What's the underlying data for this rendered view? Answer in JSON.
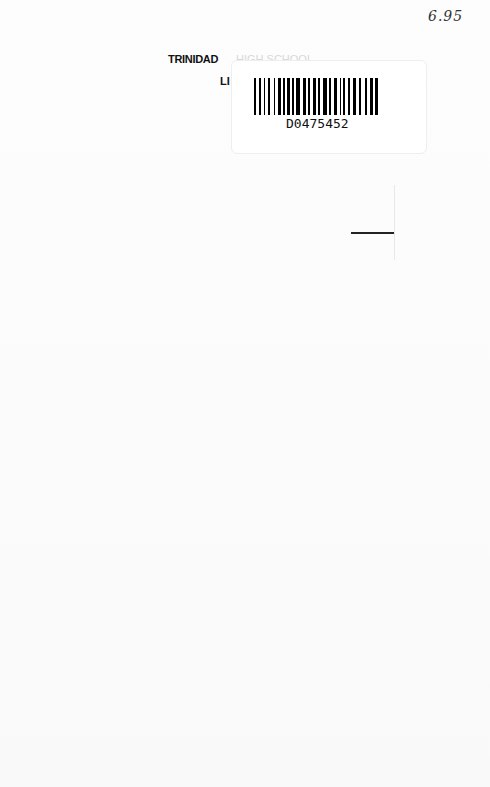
{
  "document": {
    "price_note": "6.95",
    "library_stamp": {
      "line1_visible": "TRINIDAD",
      "line1_faint": "HIGH SCHOOL",
      "line2_visible": "LI"
    },
    "barcode_label": {
      "number": "D0475452"
    }
  }
}
